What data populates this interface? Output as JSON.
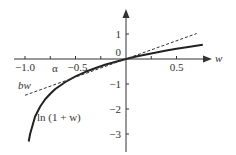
{
  "chart_data": {
    "type": "line",
    "title": "",
    "xlabel": "w",
    "ylabel": "",
    "xlim": [
      -1.0,
      0.85
    ],
    "ylim": [
      -3.7,
      1.9
    ],
    "grid": false,
    "legend": "none",
    "x_ticks": [
      -1.0,
      -0.75,
      -0.5,
      -0.25,
      0.25,
      0.5
    ],
    "x_tick_labels": [
      {
        "value": -1.0,
        "text": "−1.0"
      },
      {
        "value": -0.5,
        "text": "−0.5"
      },
      {
        "value": 0.5,
        "text": "0.5"
      }
    ],
    "y_ticks": [
      1,
      -1,
      -2,
      -3
    ],
    "y_tick_labels": [
      {
        "value": 1,
        "text": "1"
      },
      {
        "value": 0,
        "text": "0"
      },
      {
        "value": -1,
        "text": "−1"
      },
      {
        "value": -2,
        "text": "−2"
      },
      {
        "value": -3,
        "text": "−3"
      }
    ],
    "series": [
      {
        "name": "ln (1 + w)",
        "style": "solid",
        "function": "ln(1+w)",
        "x": [
          -0.963,
          -0.95,
          -0.9,
          -0.85,
          -0.8,
          -0.75,
          -0.7,
          -0.6,
          -0.5,
          -0.4,
          -0.3,
          -0.2,
          -0.1,
          0,
          0.1,
          0.2,
          0.3,
          0.4,
          0.5,
          0.6,
          0.76
        ],
        "values": [
          -3.3,
          -3.0,
          -2.3,
          -1.9,
          -1.61,
          -1.39,
          -1.2,
          -0.92,
          -0.69,
          -0.51,
          -0.36,
          -0.22,
          -0.11,
          0,
          0.1,
          0.18,
          0.26,
          0.34,
          0.41,
          0.47,
          0.57
        ]
      },
      {
        "name": "bw",
        "style": "dashed",
        "function": "b*w, b≈1.45",
        "x": [
          -1.0,
          0.7
        ],
        "values": [
          -1.45,
          1.02
        ]
      }
    ],
    "annotations": [
      {
        "text": "α",
        "x": -0.7,
        "y": 0,
        "note": "intersection point of ln(1+w) and bw on w axis"
      },
      {
        "text": "bw",
        "x": -1.0,
        "y": -1.05,
        "italic": true
      },
      {
        "text": "ln (1 + w)",
        "x": -0.9,
        "y": -2.4
      }
    ]
  },
  "labels": {
    "x_axis": "w",
    "alpha": "α",
    "bw": "bw",
    "curve": "ln (1 + w)"
  },
  "colors": {
    "curve": "#222222",
    "dashed": "#333333",
    "axis": "#333333",
    "text": "#333333"
  }
}
